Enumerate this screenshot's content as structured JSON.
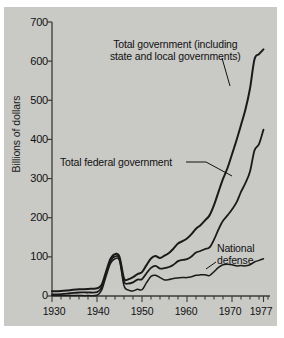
{
  "chart_data": {
    "type": "line",
    "title": "",
    "xlabel": "",
    "ylabel": "Billions of dollars",
    "xlim": [
      1930,
      1978
    ],
    "ylim": [
      0,
      700
    ],
    "grid": false,
    "legend_position": "inline-annotations",
    "xticks": [
      "1930",
      "1940",
      "1950",
      "1960",
      "1970",
      "1977"
    ],
    "xtick_values": [
      1930,
      1940,
      1950,
      1960,
      1970,
      1977
    ],
    "xminor_tick_interval": 2,
    "yticks": [
      "0",
      "100",
      "200",
      "300",
      "400",
      "500",
      "600",
      "700"
    ],
    "ytick_values": [
      0,
      100,
      200,
      300,
      400,
      500,
      600,
      700
    ],
    "annotations": [
      {
        "name": "total-government",
        "line1": "Total government (including",
        "line2": "state and local governments)"
      },
      {
        "name": "total-federal-government",
        "text": "Total federal government"
      },
      {
        "name": "national-defense",
        "line1": "National",
        "line2": "defense"
      }
    ],
    "series": [
      {
        "name": "Total government (including state and local governments)",
        "x": [
          1930,
          1932,
          1934,
          1936,
          1938,
          1940,
          1941,
          1942,
          1943,
          1944,
          1945,
          1946,
          1947,
          1948,
          1949,
          1950,
          1951,
          1952,
          1953,
          1954,
          1955,
          1956,
          1957,
          1958,
          1959,
          1960,
          1961,
          1962,
          1963,
          1964,
          1965,
          1966,
          1967,
          1968,
          1969,
          1970,
          1971,
          1972,
          1973,
          1974,
          1975,
          1976,
          1977
        ],
        "y": [
          12,
          13,
          15,
          17,
          18,
          20,
          28,
          62,
          95,
          107,
          100,
          45,
          43,
          48,
          56,
          61,
          79,
          96,
          102,
          97,
          103,
          110,
          121,
          134,
          140,
          147,
          158,
          172,
          181,
          193,
          206,
          232,
          266,
          299,
          327,
          362,
          398,
          437,
          477,
          530,
          605,
          618,
          630
        ],
        "color": "#1a1a1a",
        "width": 2.0
      },
      {
        "name": "Total federal government",
        "x": [
          1930,
          1932,
          1934,
          1936,
          1938,
          1940,
          1941,
          1942,
          1943,
          1944,
          1945,
          1946,
          1947,
          1948,
          1949,
          1950,
          1951,
          1952,
          1953,
          1954,
          1955,
          1956,
          1957,
          1958,
          1959,
          1960,
          1961,
          1962,
          1963,
          1964,
          1965,
          1966,
          1967,
          1968,
          1969,
          1970,
          1971,
          1972,
          1973,
          1974,
          1975,
          1976,
          1977
        ],
        "y": [
          4,
          5,
          7,
          9,
          9,
          10,
          21,
          56,
          89,
          101,
          95,
          37,
          32,
          35,
          42,
          43,
          58,
          72,
          77,
          70,
          71,
          74,
          80,
          89,
          92,
          94,
          101,
          111,
          115,
          120,
          124,
          144,
          170,
          192,
          206,
          221,
          239,
          266,
          289,
          318,
          372,
          388,
          425
        ],
        "color": "#1a1a1a",
        "width": 1.8
      },
      {
        "name": "National defense",
        "x": [
          1930,
          1932,
          1934,
          1936,
          1938,
          1940,
          1941,
          1942,
          1943,
          1944,
          1945,
          1946,
          1947,
          1948,
          1949,
          1950,
          1951,
          1952,
          1953,
          1954,
          1955,
          1956,
          1957,
          1958,
          1959,
          1960,
          1961,
          1962,
          1963,
          1964,
          1965,
          1966,
          1967,
          1968,
          1969,
          1970,
          1971,
          1972,
          1973,
          1974,
          1975,
          1976,
          1977
        ],
        "y": [
          1,
          1,
          1,
          1,
          1,
          2,
          14,
          50,
          83,
          95,
          90,
          26,
          15,
          13,
          17,
          16,
          34,
          50,
          53,
          47,
          41,
          42,
          45,
          46,
          47,
          47,
          49,
          53,
          54,
          54,
          52,
          62,
          73,
          80,
          81,
          80,
          77,
          78,
          77,
          80,
          87,
          91,
          95
        ],
        "color": "#1a1a1a",
        "width": 1.5
      }
    ]
  }
}
